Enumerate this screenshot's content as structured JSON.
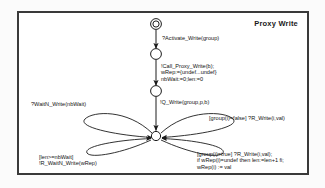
{
  "diagram": {
    "title": "Proxy Write",
    "type": "state-machine",
    "states": [
      {
        "id": "s0",
        "kind": "initial",
        "label": "",
        "x": 137,
        "y": 11
      },
      {
        "id": "s1",
        "kind": "state",
        "label": "",
        "x": 137,
        "y": 41
      },
      {
        "id": "s2",
        "kind": "state",
        "label": "",
        "x": 137,
        "y": 78
      },
      {
        "id": "s3",
        "kind": "state",
        "label": "",
        "x": 137,
        "y": 123
      }
    ],
    "transitions": [
      {
        "id": "t1",
        "from": "s0",
        "to": "s1",
        "label": "?Activate_Write(group)",
        "label_x": 143,
        "label_y": 22
      },
      {
        "id": "t2",
        "from": "s1",
        "to": "s2",
        "label": "!Call_Proxy_Write(b);\nwRep:={undef...undef}\nnbWait:=0;len:=0",
        "label_x": 142,
        "label_y": 50
      },
      {
        "id": "t3",
        "from": "s2",
        "to": "s3",
        "label": "!Q_Write(group,p,b)",
        "label_x": 141,
        "label_y": 86
      },
      {
        "id": "t4",
        "from": "s3",
        "to": "s3",
        "label": "?WaitN_Write(nbWait)",
        "label_x": 12,
        "label_y": 88
      },
      {
        "id": "t5",
        "from": "s3",
        "to": "s3",
        "label": "[group(i)=false] ?R_Write(i,val)",
        "label_x": 190,
        "label_y": 102
      },
      {
        "id": "t6",
        "from": "s3",
        "to": "s3",
        "label": "[group(i)=true] ?R_Write(i,val);\nif wRep(i)=undef then len:=len+1 fi;\nwRep(i) := val",
        "label_x": 178,
        "label_y": 138
      },
      {
        "id": "t7",
        "from": "s3",
        "to": "s3",
        "label": "[len>=nbWait]\n!R_WaitN_Write(wRep)",
        "label_x": 20,
        "label_y": 141
      }
    ],
    "colors": {
      "stroke": "#1c1c1c",
      "frame": "#3a3a3a",
      "background": "#ffffff",
      "text": "#141414"
    }
  }
}
